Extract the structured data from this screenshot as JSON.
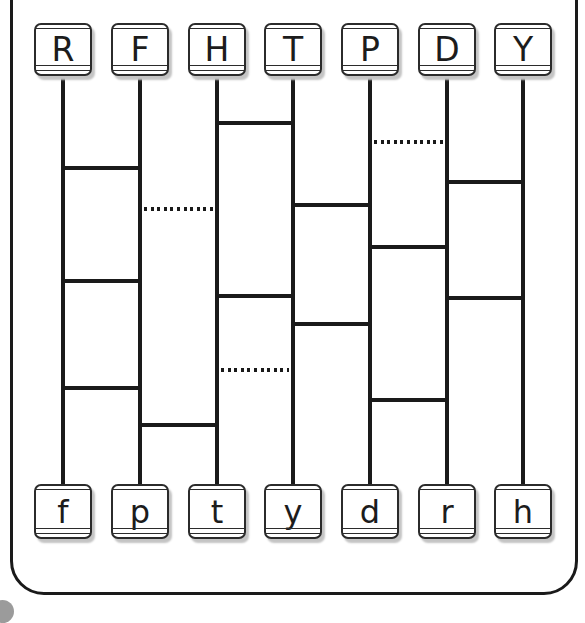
{
  "puzzle": {
    "type": "letter-matching-ladder-maze",
    "top_labels": [
      "R",
      "F",
      "H",
      "T",
      "P",
      "D",
      "Y"
    ],
    "bottom_labels": [
      "f",
      "p",
      "t",
      "y",
      "d",
      "r",
      "h"
    ],
    "columns_x": [
      63,
      140,
      217,
      293,
      370,
      447,
      523
    ],
    "rungs": [
      {
        "left_column": 2,
        "y": 123,
        "style": "solid"
      },
      {
        "left_column": 4,
        "y": 142,
        "style": "dotted"
      },
      {
        "left_column": 0,
        "y": 168,
        "style": "solid"
      },
      {
        "left_column": 5,
        "y": 182,
        "style": "solid"
      },
      {
        "left_column": 3,
        "y": 205,
        "style": "solid"
      },
      {
        "left_column": 1,
        "y": 209,
        "style": "dotted"
      },
      {
        "left_column": 4,
        "y": 247,
        "style": "solid"
      },
      {
        "left_column": 0,
        "y": 281,
        "style": "solid"
      },
      {
        "left_column": 2,
        "y": 296,
        "style": "solid"
      },
      {
        "left_column": 5,
        "y": 298,
        "style": "solid"
      },
      {
        "left_column": 3,
        "y": 324,
        "style": "solid"
      },
      {
        "left_column": 2,
        "y": 370,
        "style": "dotted"
      },
      {
        "left_column": 0,
        "y": 388,
        "style": "solid"
      },
      {
        "left_column": 4,
        "y": 400,
        "style": "solid"
      },
      {
        "left_column": 1,
        "y": 425,
        "style": "solid"
      }
    ],
    "top_tile_y": 23,
    "bottom_tile_y": 484,
    "colors": {
      "line": "#1a1a1a",
      "tile_border": "#2b2b2b",
      "tile_shadow": "#c4c4c4",
      "page_bubble": "#9b9b9b"
    }
  }
}
